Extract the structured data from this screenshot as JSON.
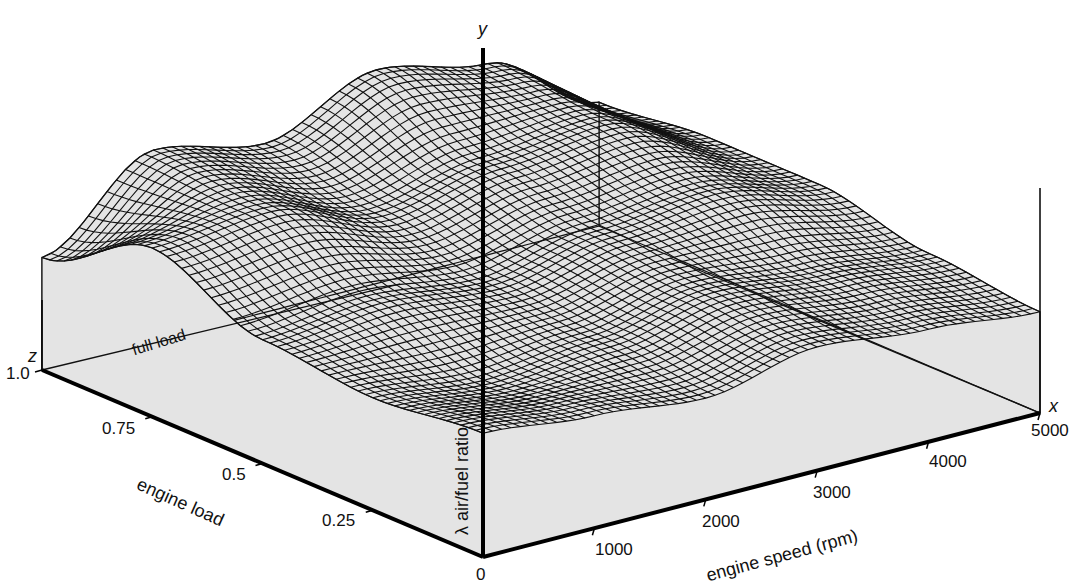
{
  "chart_data": {
    "type": "surface",
    "title": "",
    "axes": {
      "x": {
        "letter": "x",
        "label": "engine speed (rpm)",
        "range": [
          0,
          5000
        ],
        "ticks": [
          1000,
          2000,
          3000,
          4000,
          5000
        ]
      },
      "z": {
        "letter": "z",
        "label": "engine load",
        "range": [
          0,
          1.0
        ],
        "ticks": [
          0.25,
          0.5,
          0.75,
          1.0
        ]
      },
      "y": {
        "letter": "y",
        "label": "λ air/fuel ratio"
      }
    },
    "origin_label": "0",
    "annotations": [
      "full load"
    ],
    "grid": false,
    "surface_style": "black wireframe mesh over light grey floor",
    "approx_surface_heights": {
      "note": "relative heights (0-1) read visually; speed columns x load rows",
      "speed": [
        0,
        1000,
        2000,
        3000,
        4000,
        5000
      ],
      "load": [
        0,
        0.25,
        0.5,
        0.75,
        1.0
      ],
      "values": [
        [
          0.55,
          0.5,
          0.45,
          0.55,
          0.5,
          0.45
        ],
        [
          0.5,
          0.45,
          0.5,
          0.6,
          0.55,
          0.5
        ],
        [
          0.55,
          0.6,
          0.55,
          0.65,
          0.7,
          0.6
        ],
        [
          0.75,
          0.8,
          0.65,
          0.75,
          0.8,
          0.6
        ],
        [
          0.5,
          0.85,
          0.75,
          0.95,
          0.85,
          0.55
        ]
      ]
    }
  },
  "labels": {
    "y_letter": "y",
    "x_letter": "x",
    "z_letter": "z",
    "y_axis_title": "λ air/fuel ratio",
    "x_axis_title": "engine speed (rpm)",
    "z_axis_title": "engine load",
    "origin": "0",
    "full_load": "full load",
    "z_ticks": [
      "1.0",
      "0.75",
      "0.5",
      "0.25"
    ],
    "x_ticks": [
      "1000",
      "2000",
      "3000",
      "4000",
      "5000"
    ]
  },
  "colors": {
    "floor": "#e4e4e4",
    "mesh": "#111111",
    "axis": "#000000"
  }
}
